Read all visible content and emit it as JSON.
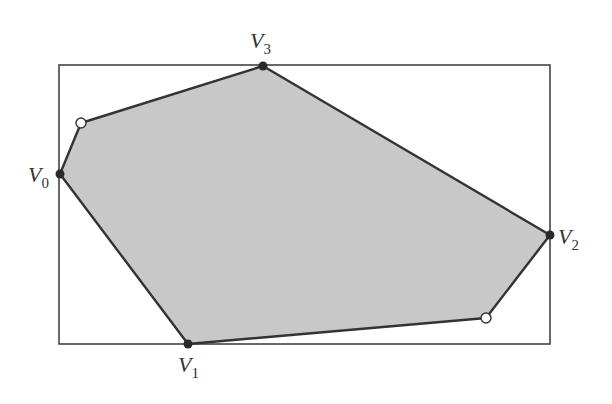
{
  "diagram": {
    "colors": {
      "polygon_fill": "#c8c8c8",
      "polygon_stroke": "#333333",
      "rect_stroke": "#444444",
      "vertex_fill": "#2a2a2a",
      "open_vertex_fill": "#ffffff"
    },
    "bounding_box": {
      "x": 59,
      "y": 65,
      "width": 491,
      "height": 279
    },
    "polygon_points": [
      [
        60,
        174
      ],
      [
        81,
        123
      ],
      [
        263,
        66
      ],
      [
        550,
        235
      ],
      [
        486,
        318
      ],
      [
        188,
        344
      ]
    ],
    "labeled_vertices": [
      {
        "id": "V0",
        "letter": "V",
        "sub": "0",
        "x": 60,
        "y": 174,
        "lx": 28,
        "ly": 182
      },
      {
        "id": "V1",
        "letter": "V",
        "sub": "1",
        "x": 188,
        "y": 344,
        "lx": 178,
        "ly": 372
      },
      {
        "id": "V2",
        "letter": "V",
        "sub": "2",
        "x": 550,
        "y": 235,
        "lx": 558,
        "ly": 244
      },
      {
        "id": "V3",
        "letter": "V",
        "sub": "3",
        "x": 263,
        "y": 66,
        "lx": 250,
        "ly": 48
      }
    ],
    "open_vertices": [
      {
        "x": 81,
        "y": 123
      },
      {
        "x": 486,
        "y": 318
      }
    ]
  }
}
